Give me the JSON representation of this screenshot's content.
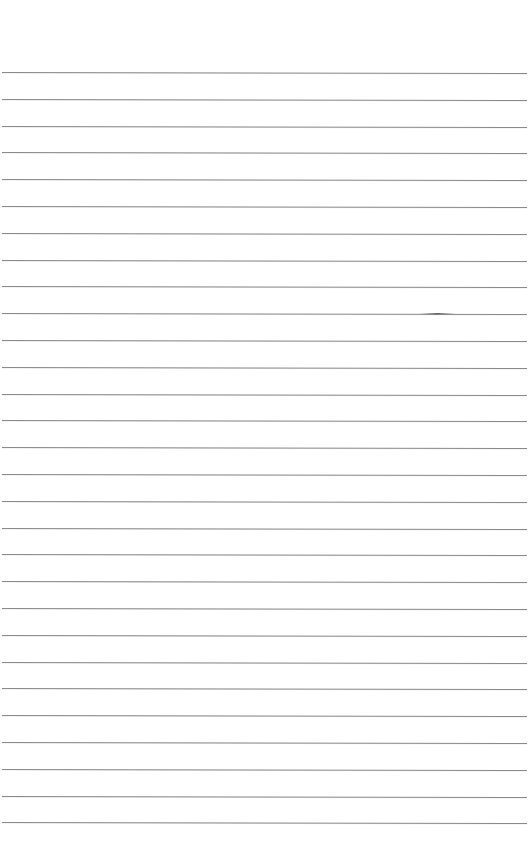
{
  "page": {
    "type": "lined-paper",
    "background_color": "#ffffff",
    "rule_color": "#8a8a8a",
    "rule_count": 29,
    "first_rule_y": 72,
    "rule_spacing": 26.8
  }
}
